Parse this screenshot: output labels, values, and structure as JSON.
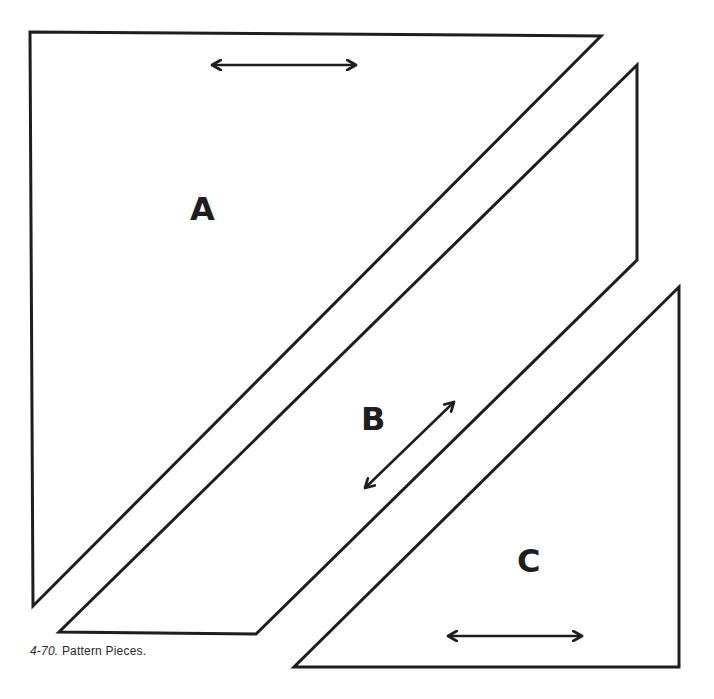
{
  "figure": {
    "caption_number": "4-70.",
    "caption_text": "Pattern Pieces.",
    "stroke_color": "#1e1e1e",
    "background_color": "#ffffff",
    "pieces": [
      {
        "label": "A",
        "shape": "right-triangle",
        "points": [
          [
            30,
            32
          ],
          [
            601,
            36
          ],
          [
            33,
            606
          ]
        ],
        "grain_arrow": {
          "from": [
            209,
            65
          ],
          "to": [
            359,
            65
          ],
          "orientation": "horizontal"
        }
      },
      {
        "label": "B",
        "shape": "parallelogram",
        "points": [
          [
            637,
            65
          ],
          [
            637,
            260
          ],
          [
            256,
            634
          ],
          [
            59,
            632
          ]
        ],
        "grain_arrow": {
          "from": [
            363,
            490
          ],
          "to": [
            456,
            400
          ],
          "orientation": "diagonal"
        }
      },
      {
        "label": "C",
        "shape": "right-triangle",
        "points": [
          [
            679,
            287
          ],
          [
            679,
            667
          ],
          [
            294,
            667
          ]
        ],
        "grain_arrow": {
          "from": [
            445,
            636
          ],
          "to": [
            585,
            636
          ],
          "orientation": "horizontal"
        }
      }
    ]
  }
}
